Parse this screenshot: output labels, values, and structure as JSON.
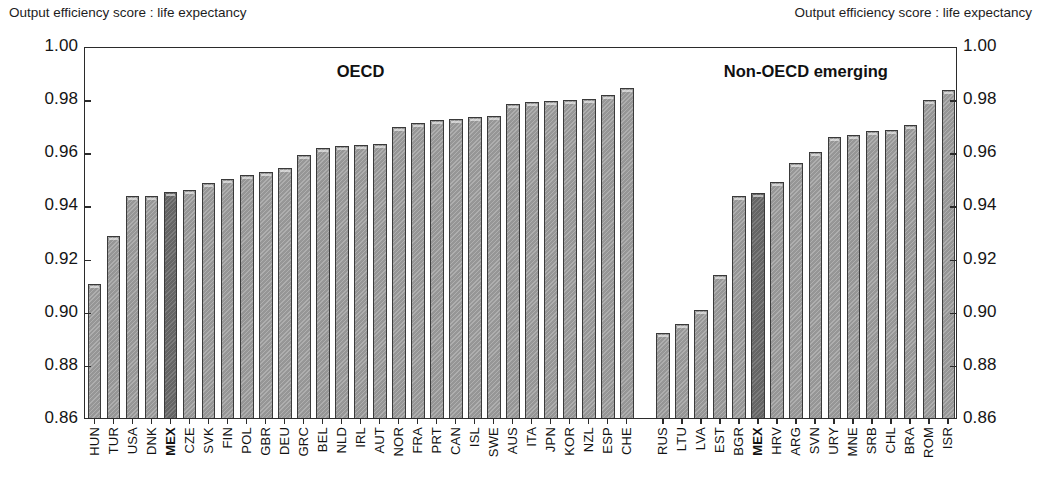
{
  "axis_caption_left": "Output efficiency score : life expectancy",
  "axis_caption_right": "Output efficiency score : life expectancy",
  "panels": {
    "left_title": "OECD",
    "right_title": "Non-OECD emerging"
  },
  "y_ticks": [
    "1.00",
    "0.98",
    "0.96",
    "0.94",
    "0.92",
    "0.90",
    "0.88",
    "0.86"
  ],
  "chart_data": {
    "type": "bar",
    "title": "Output efficiency score : life expectancy",
    "xlabel": "",
    "ylabel": "Output efficiency score : life expectancy",
    "ylim": [
      0.86,
      1.0
    ],
    "ytick_values": [
      0.86,
      0.88,
      0.9,
      0.92,
      0.94,
      0.96,
      0.98,
      1.0
    ],
    "grid": false,
    "legend": "none",
    "highlight_color": "#6a6a6a",
    "bar_color": "#9b9b9b",
    "panels": [
      {
        "name": "OECD",
        "categories": [
          "HUN",
          "TUR",
          "USA",
          "DNK",
          "MEX",
          "CZE",
          "SVK",
          "FIN",
          "POL",
          "GBR",
          "DEU",
          "GRC",
          "BEL",
          "NLD",
          "IRL",
          "AUT",
          "NOR",
          "FRA",
          "PRT",
          "CAN",
          "ISL",
          "SWE",
          "AUS",
          "ITA",
          "JPN",
          "KOR",
          "NZL",
          "ESP",
          "CHE"
        ],
        "values": [
          0.9105,
          0.9285,
          0.9435,
          0.9437,
          0.9452,
          0.9457,
          0.9483,
          0.9499,
          0.9513,
          0.9524,
          0.954,
          0.9591,
          0.9617,
          0.9625,
          0.9628,
          0.9631,
          0.9696,
          0.9711,
          0.9722,
          0.9727,
          0.9733,
          0.9736,
          0.978,
          0.9789,
          0.9793,
          0.9797,
          0.98,
          0.9814,
          0.9841
        ],
        "highlighted": [
          "MEX"
        ]
      },
      {
        "name": "Non-OECD emerging",
        "categories": [
          "RUS",
          "LTU",
          "LVA",
          "EST",
          "BGR",
          "MEX",
          "HRV",
          "ARG",
          "SVN",
          "URY",
          "MNE",
          "SRB",
          "CHL",
          "BRA",
          "ROM",
          "ISR"
        ],
        "values": [
          0.8921,
          0.8955,
          0.9008,
          0.9139,
          0.9434,
          0.9448,
          0.9489,
          0.9558,
          0.9602,
          0.9656,
          0.9665,
          0.968,
          0.9683,
          0.9704,
          0.9797,
          0.9834
        ],
        "highlighted": [
          "MEX"
        ]
      }
    ]
  }
}
